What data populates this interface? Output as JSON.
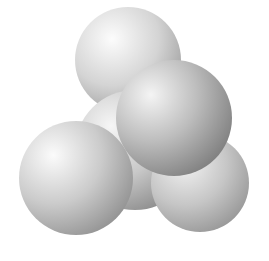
{
  "image": {
    "subject": "space-filling molecular model",
    "atom_count": 5,
    "background": "#ffffff",
    "atoms": [
      {
        "name": "center-atom",
        "cx": 135,
        "cy": 150,
        "r": 60,
        "light": "#f4f4f4",
        "dark": "#8a8a8a"
      },
      {
        "name": "top-atom",
        "cx": 128,
        "cy": 60,
        "r": 53,
        "light": "#fafafa",
        "dark": "#9a9a9a"
      },
      {
        "name": "bottom-right-atom",
        "cx": 200,
        "cy": 183,
        "r": 49,
        "light": "#f2f2f2",
        "dark": "#8c8c8c"
      },
      {
        "name": "left-atom",
        "cx": 76,
        "cy": 178,
        "r": 57,
        "light": "#fbfbfb",
        "dark": "#8a8a8a"
      },
      {
        "name": "front-atom",
        "cx": 174,
        "cy": 118,
        "r": 58,
        "light": "#f0f0f0",
        "dark": "#7e7e7e"
      }
    ]
  }
}
